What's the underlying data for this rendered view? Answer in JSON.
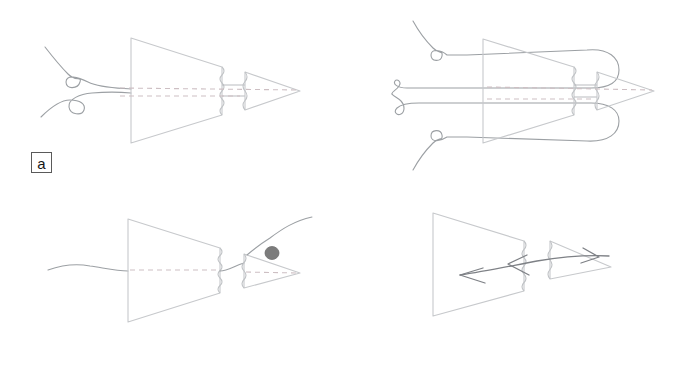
{
  "figure": {
    "width": 694,
    "height": 383,
    "background": "#ffffff",
    "stroke_light": "#c9cbce",
    "stroke_mid": "#8d9094",
    "stroke_dark": "#6b6e72",
    "blob_color": "#7c7c7c",
    "dashed_axis_color": "#c5b9bd"
  },
  "panels": [
    {
      "id": "a",
      "label": "a",
      "caption_box": true,
      "contents": [
        "funnel-outline",
        "crimped-outlet",
        "nozzle-triangle",
        "dashed-center-axis",
        "single-filament-with-two-loops-entering-from-left"
      ]
    },
    {
      "id": "b",
      "label": "b",
      "caption_box": true,
      "contents": [
        "funnel-outline",
        "crimped-outlet",
        "nozzle-triangle",
        "dashed-center-axis",
        "filament-looped-around-funnel-forming-upper-and-lower-rounded-loops"
      ]
    },
    {
      "id": "c",
      "label": "c",
      "caption_box": true,
      "contents": [
        "funnel-outline",
        "crimped-outlet",
        "nozzle-triangle",
        "dashed-center-axis",
        "single-filament-threaded-straight-through",
        "gray-bead-blob-on-filament-upper-right"
      ]
    },
    {
      "id": "d",
      "label": "d",
      "caption_box": true,
      "contents": [
        "funnel-outline",
        "crimped-outlet",
        "nozzle-triangle",
        "flow-curve-with-two-left-arrowheads-inside-funnel",
        "flow-curve-with-right-arrowhead-in-nozzle"
      ]
    }
  ]
}
